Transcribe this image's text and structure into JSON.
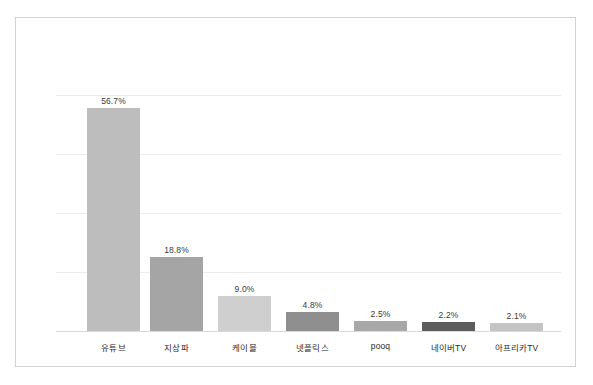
{
  "chart_data": {
    "type": "bar",
    "title": "",
    "subtitle": "",
    "xlabel": "",
    "ylabel": "",
    "categories": [
      "유튜브",
      "지상파",
      "케이블",
      "넷플릭스",
      "pooq",
      "네이버TV",
      "아프리카TV"
    ],
    "values": [
      56.7,
      18.8,
      9.0,
      4.8,
      2.5,
      2.2,
      2.1
    ],
    "value_labels": [
      "56.7%",
      "18.8%",
      "9.0%",
      "4.8%",
      "2.5%",
      "2.2%",
      "2.1%"
    ],
    "unit": "%",
    "ylim": [
      0,
      70
    ],
    "grid": true,
    "grid_axis": "y",
    "gridline_values": [
      15,
      30,
      45,
      60
    ],
    "legend": false,
    "legend_position": "none",
    "tick_labels_y": [],
    "bar_colors": [
      "#bdbdbd",
      "#a5a5a5",
      "#cfcfcf",
      "#8f8f8f",
      "#a8a8a8",
      "#5c5c5c",
      "#c4c4c4"
    ],
    "value_label_color": "#3a3a3a",
    "category_label_color": "#2b2b2b",
    "gridline_color": "#ececec",
    "axis_color": "#d9d9d9",
    "frame_color": "#d2d2d2",
    "background_color": "#ffffff"
  }
}
